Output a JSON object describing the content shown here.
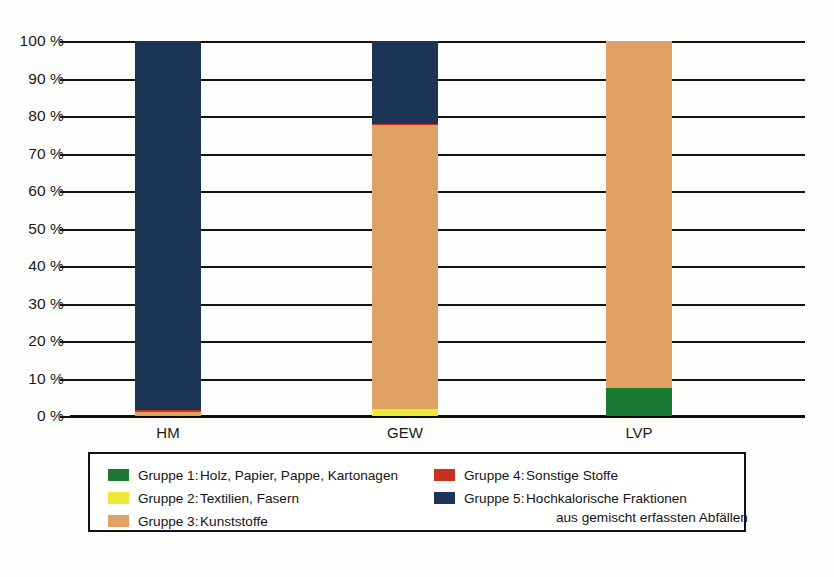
{
  "chart_data": {
    "type": "bar",
    "subtype": "stacked-100-percent",
    "title": "",
    "subtitle": "",
    "xlabel": "",
    "ylabel": "",
    "categories": [
      "HM",
      "GEW",
      "LVP"
    ],
    "ylim": [
      0,
      100
    ],
    "yticks": [
      0,
      10,
      20,
      30,
      40,
      50,
      60,
      70,
      80,
      90,
      100
    ],
    "ytick_labels": [
      "0 %",
      "10 %",
      "20 %",
      "30 %",
      "40 %",
      "50 %",
      "60 %",
      "70 %",
      "80 %",
      "90 %",
      "100 %"
    ],
    "grid": true,
    "grid_axis": "y",
    "legend_position": "bottom",
    "series": [
      {
        "name": "Gruppe 1",
        "label": "Gruppe 1:  Holz, Papier, Pappe, Kartonagen",
        "color": "#1a7a33",
        "values": [
          0,
          0,
          7.5
        ]
      },
      {
        "name": "Gruppe 2",
        "label": "Gruppe 2:  Textilien, Fasern",
        "color": "#ede93a",
        "values": [
          0,
          2.0,
          0
        ]
      },
      {
        "name": "Gruppe 3",
        "label": "Gruppe 3:  Kunststoffe",
        "color": "#e0a264",
        "values": [
          1.2,
          75.8,
          92.5
        ]
      },
      {
        "name": "Gruppe 4",
        "label": "Gruppe 4:  Sonstige Stoffe",
        "color": "#c8321e",
        "values": [
          0.5,
          0.2,
          0
        ]
      },
      {
        "name": "Gruppe 5",
        "label": "Gruppe 5:  Hochkalorische Fraktionen aus gemischt erfassten Abfällen",
        "color": "#1c3557",
        "values": [
          98.3,
          22.0,
          0
        ]
      }
    ]
  },
  "axis": {
    "y_labels": [
      "100 %",
      "90 %",
      "80 %",
      "70 %",
      "60 %",
      "50 %",
      "40 %",
      "30 %",
      "20 %",
      "10 %",
      "0 %"
    ],
    "x_labels": [
      "HM",
      "GEW",
      "LVP"
    ]
  },
  "legend": {
    "column_left": [
      {
        "swatch_color": "#1a7a33",
        "key": "Gruppe 1:",
        "desc": "Holz, Papier, Pappe, Kartonagen",
        "subline": ""
      },
      {
        "swatch_color": "#ede93a",
        "key": "Gruppe 2:",
        "desc": "Textilien, Fasern",
        "subline": ""
      },
      {
        "swatch_color": "#e0a264",
        "key": "Gruppe 3:",
        "desc": "Kunststoffe",
        "subline": ""
      }
    ],
    "column_right": [
      {
        "swatch_color": "#c8321e",
        "key": "Gruppe 4:",
        "desc": "Sonstige Stoffe",
        "subline": ""
      },
      {
        "swatch_color": "#1c3557",
        "key": "Gruppe 5:",
        "desc": "Hochkalorische Fraktionen",
        "subline": "aus gemischt erfassten Abfällen"
      }
    ]
  },
  "colors": {
    "gruppe1_green": "#1a7a33",
    "gruppe2_yellow": "#ede93a",
    "gruppe3_tan": "#e0a264",
    "gruppe4_red": "#c8321e",
    "gruppe5_navy": "#1c3557",
    "axis_line": "#15120f",
    "text": "#1a1a1a",
    "background": "#fdfdfc"
  }
}
